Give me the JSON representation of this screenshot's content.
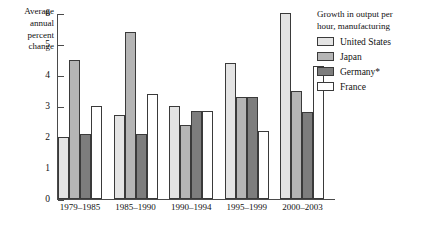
{
  "chart_data": {
    "type": "bar",
    "title": "Growth in output per hour, manufacturing",
    "ylabel": "Average annual percent change",
    "xlabel": "",
    "categories": [
      "1979–1985",
      "1985–1990",
      "1990–1994",
      "1995–1999",
      "2000–2003"
    ],
    "series": [
      {
        "name": "United States",
        "color": "#e4e4e4",
        "values": [
          2.0,
          2.7,
          3.0,
          4.4,
          6.0
        ]
      },
      {
        "name": "Japan",
        "color": "#b5b5b5",
        "values": [
          4.5,
          5.4,
          2.4,
          3.3,
          3.5
        ]
      },
      {
        "name": "Germany*",
        "color": "#7d7d7d",
        "values": [
          2.1,
          2.1,
          2.85,
          3.3,
          2.8
        ]
      },
      {
        "name": "France",
        "color": "#ffffff",
        "values": [
          3.0,
          3.4,
          2.85,
          2.2,
          4.3
        ]
      }
    ],
    "ylim": [
      0,
      6
    ],
    "yticks": [
      0,
      1,
      2,
      3,
      4,
      5,
      6
    ],
    "ytick_labels": [
      "0",
      "1",
      "2",
      "3",
      "4",
      "5",
      "6"
    ],
    "grid": false,
    "legend_position": "top-right"
  },
  "axis": {
    "title_lines": [
      "Average",
      "annual",
      "percent",
      "change"
    ]
  },
  "legend": {
    "title_lines": [
      "Growth in output per",
      "hour, manufacturing"
    ]
  }
}
